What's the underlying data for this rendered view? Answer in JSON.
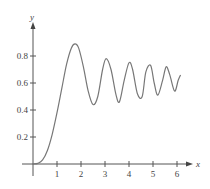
{
  "chart_data": {
    "type": "line",
    "title": "",
    "xlabel": "x",
    "ylabel": "y",
    "xlim": [
      0,
      6.5
    ],
    "ylim": [
      0,
      1.0
    ],
    "grid": false,
    "legend": null,
    "x_ticks": [
      "1",
      "2",
      "3",
      "4",
      "5",
      "6"
    ],
    "y_ticks": [
      "0.2",
      "0.4",
      "0.6",
      "0.8"
    ],
    "series": [
      {
        "name": "curve",
        "color": "#777777",
        "x": [
          0,
          0.2,
          0.4,
          0.6,
          0.8,
          1.0,
          1.2,
          1.4,
          1.6,
          1.75,
          1.9,
          2.1,
          2.3,
          2.5,
          2.7,
          2.9,
          3.05,
          3.25,
          3.45,
          3.6,
          3.8,
          4.0,
          4.15,
          4.35,
          4.55,
          4.7,
          4.9,
          5.05,
          5.2,
          5.4,
          5.55,
          5.7,
          5.9,
          6.05,
          6.15
        ],
        "values": [
          0.0,
          0.005,
          0.03,
          0.1,
          0.22,
          0.38,
          0.56,
          0.74,
          0.86,
          0.89,
          0.86,
          0.72,
          0.54,
          0.44,
          0.5,
          0.7,
          0.78,
          0.7,
          0.52,
          0.46,
          0.62,
          0.75,
          0.7,
          0.52,
          0.5,
          0.68,
          0.73,
          0.6,
          0.51,
          0.62,
          0.72,
          0.66,
          0.54,
          0.62,
          0.66
        ]
      }
    ],
    "annotations": []
  }
}
